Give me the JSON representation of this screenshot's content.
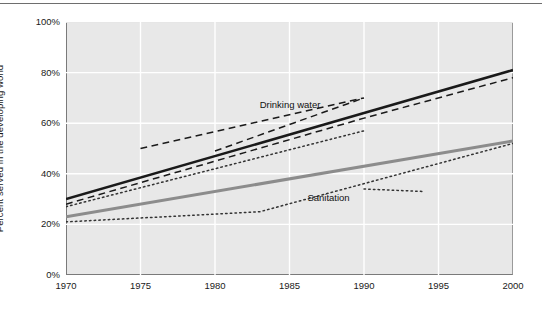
{
  "chart_data": {
    "type": "line",
    "title": "",
    "subtitle": "",
    "xlabel": "",
    "ylabel": "Percent served in the developing world",
    "xlim": [
      1970,
      2000
    ],
    "ylim": [
      0,
      100
    ],
    "grid": true,
    "legend_position": "inline-annotations",
    "x_ticks": [
      "1970",
      "1975",
      "1980",
      "1985",
      "1990",
      "1995",
      "2000"
    ],
    "x_tick_values": [
      1970,
      1975,
      1980,
      1985,
      1990,
      1995,
      2000
    ],
    "y_ticks": [
      "0%",
      "20%",
      "40%",
      "60%",
      "80%",
      "100%"
    ],
    "y_tick_values": [
      0,
      20,
      40,
      60,
      80,
      100
    ],
    "annotations": [
      {
        "name": "drinking-water-label",
        "text": "Drinking water",
        "x": 1983.0,
        "y": 67.0
      },
      {
        "name": "sanitation-label",
        "text": "Sanitation",
        "x": 1986.2,
        "y": 30.5
      }
    ],
    "series": [
      {
        "name": "Drinking water trend",
        "style": "solid",
        "color": "#1a1a1a",
        "width": 2.6,
        "x": [
          1970,
          1990,
          2000
        ],
        "values": [
          30,
          64,
          81
        ]
      },
      {
        "name": "Drinking water dashed estimate A",
        "style": "dashed",
        "color": "#1a1a1a",
        "width": 1.5,
        "x": [
          1970,
          1990,
          2000
        ],
        "values": [
          28,
          62,
          78
        ]
      },
      {
        "name": "Drinking water dashed estimate B",
        "style": "dashed",
        "color": "#1a1a1a",
        "width": 1.5,
        "x": [
          1975,
          1990
        ],
        "values": [
          50,
          70
        ]
      },
      {
        "name": "Drinking water dashed estimate C",
        "style": "dashed",
        "color": "#1a1a1a",
        "width": 1.5,
        "x": [
          1980,
          1990
        ],
        "values": [
          49,
          70
        ]
      },
      {
        "name": "Drinking water dotted estimate",
        "style": "dotted",
        "color": "#333333",
        "width": 1.5,
        "x": [
          1970,
          1990
        ],
        "values": [
          27,
          57
        ]
      },
      {
        "name": "Sanitation trend",
        "style": "solid",
        "color": "#8c8c8c",
        "width": 3.0,
        "x": [
          1970,
          2000
        ],
        "values": [
          23,
          53
        ]
      },
      {
        "name": "Sanitation dotted estimate A",
        "style": "dotted",
        "color": "#333333",
        "width": 1.5,
        "x": [
          1970,
          1983,
          2000
        ],
        "values": [
          21,
          25,
          52
        ]
      },
      {
        "name": "Sanitation dotted estimate B",
        "style": "dotted",
        "color": "#333333",
        "width": 1.5,
        "x": [
          1990,
          1994
        ],
        "values": [
          34,
          33
        ]
      }
    ]
  }
}
